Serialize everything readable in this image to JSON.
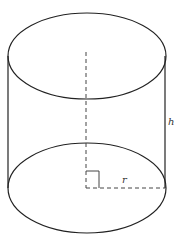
{
  "figure": {
    "type": "cylinder",
    "labels": {
      "height": "h",
      "radius": "r"
    },
    "cut_off_text": "...",
    "colors": {
      "stroke": "#222222",
      "dash": "#444444",
      "background": "#ffffff"
    }
  }
}
